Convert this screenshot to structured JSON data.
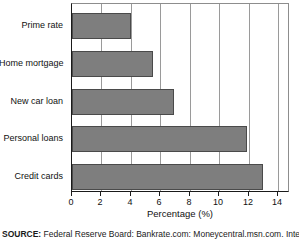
{
  "chart_data": {
    "type": "bar",
    "orientation": "horizontal",
    "title": "",
    "subtitle": "",
    "categories": [
      "Prime rate",
      "Home mortgage",
      "New car loan",
      "Personal loans",
      "Credit cards"
    ],
    "values": [
      4.0,
      5.5,
      6.9,
      11.9,
      13.0
    ],
    "series": [
      {
        "name": "Percentage",
        "values": [
          4.0,
          5.5,
          6.9,
          11.9,
          13.0
        ]
      }
    ],
    "xlabel": "Percentage (%)",
    "ylabel": "",
    "xlim": [
      0,
      14.8
    ],
    "xticks": [
      0,
      2,
      4,
      6,
      8,
      10,
      12,
      14
    ],
    "xticklabels": [
      "0",
      "2",
      "4",
      "6",
      "8",
      "10",
      "12",
      "14"
    ],
    "grid": "vertical",
    "legend": "none",
    "bar_color": "#7e7e7e",
    "bar_edge_color": "#4a4a4a",
    "gridline_color": "#9a9a9a",
    "axis_color": "#1a1a1a"
  },
  "source": {
    "label": "SOURCE:",
    "text": " Federal Reserve Board: Bankrate.com: Moneycentral.msn.com. Interest"
  }
}
